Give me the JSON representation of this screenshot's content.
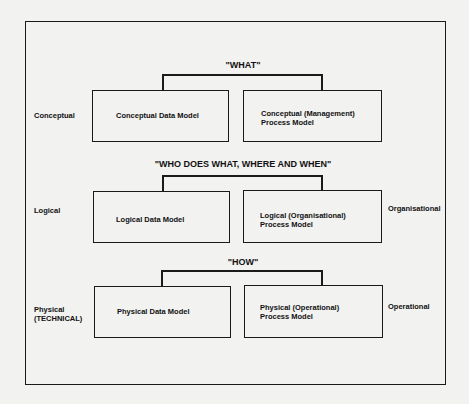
{
  "diagram": {
    "rows": [
      {
        "level_label": [
          "Conceptual"
        ],
        "title": "\"WHAT\"",
        "data_model": "Conceptual Data Model",
        "process_model": [
          "Conceptual (Management)",
          "Process Model"
        ],
        "right_label": ""
      },
      {
        "level_label": [
          "Logical"
        ],
        "title": "\"WHO DOES WHAT, WHERE AND WHEN\"",
        "data_model": "Logical Data Model",
        "process_model": [
          "Logical (Organisational)",
          "Process Model"
        ],
        "right_label": "Organisational"
      },
      {
        "level_label": [
          "Physical",
          "(TECHNICAL)"
        ],
        "title": "\"HOW\"",
        "data_model": "Physical Data Model",
        "process_model": [
          "Physical (Operational)",
          "Process Model"
        ],
        "right_label": "Operational"
      }
    ],
    "colors": {
      "background": "#f2f2f0",
      "line": "#1a1a1a",
      "text": "#111111"
    }
  }
}
